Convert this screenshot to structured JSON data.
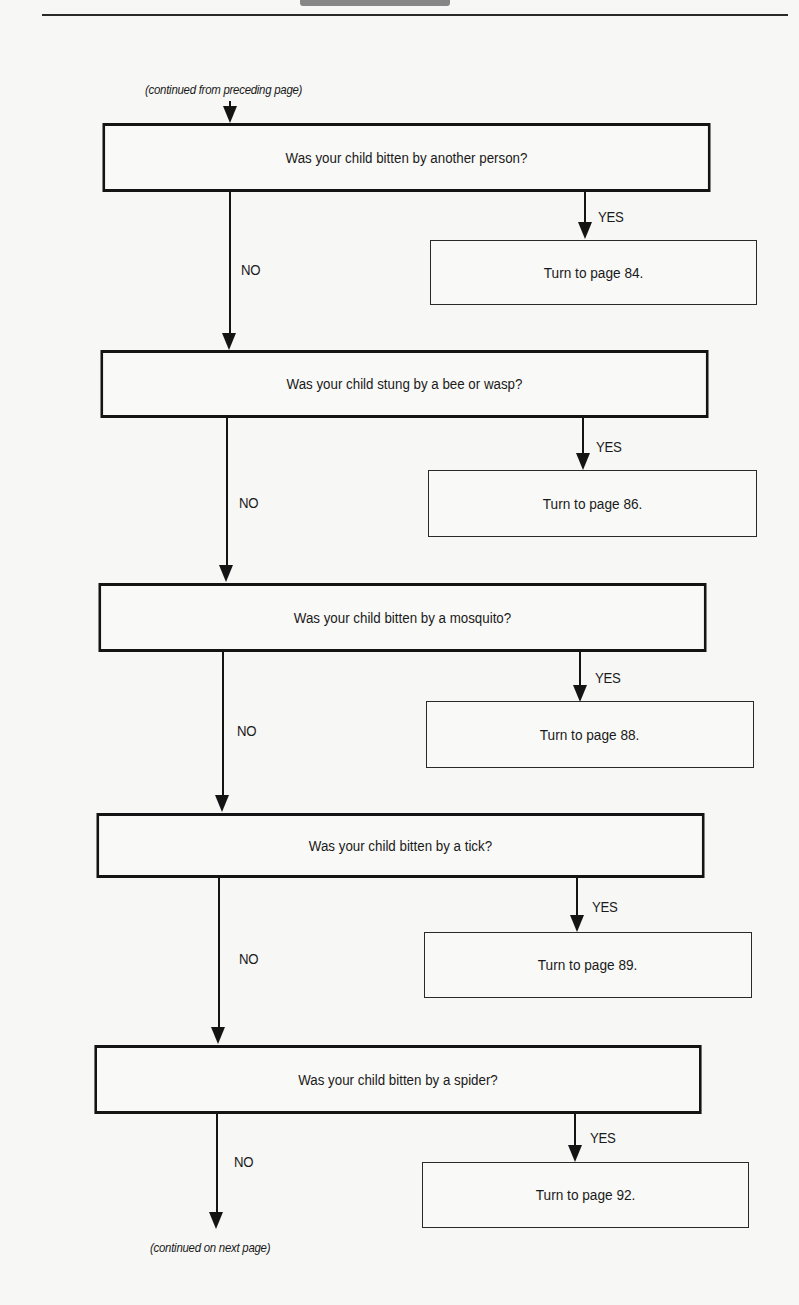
{
  "page": {
    "continued_from": "(continued from preceding page)",
    "continued_on": "(continued on next page)"
  },
  "flowchart": {
    "yes_label": "YES",
    "no_label": "NO",
    "steps": [
      {
        "question": "Was your child bitten by another person?",
        "yes_action": "Turn to page 84."
      },
      {
        "question": "Was your child stung by a bee or wasp?",
        "yes_action": "Turn to page 86."
      },
      {
        "question": "Was your child bitten by a mosquito?",
        "yes_action": "Turn to page 88."
      },
      {
        "question": "Was your child bitten by a tick?",
        "yes_action": "Turn to page 89."
      },
      {
        "question": "Was your child bitten by a spider?",
        "yes_action": "Turn to page 92."
      }
    ]
  }
}
